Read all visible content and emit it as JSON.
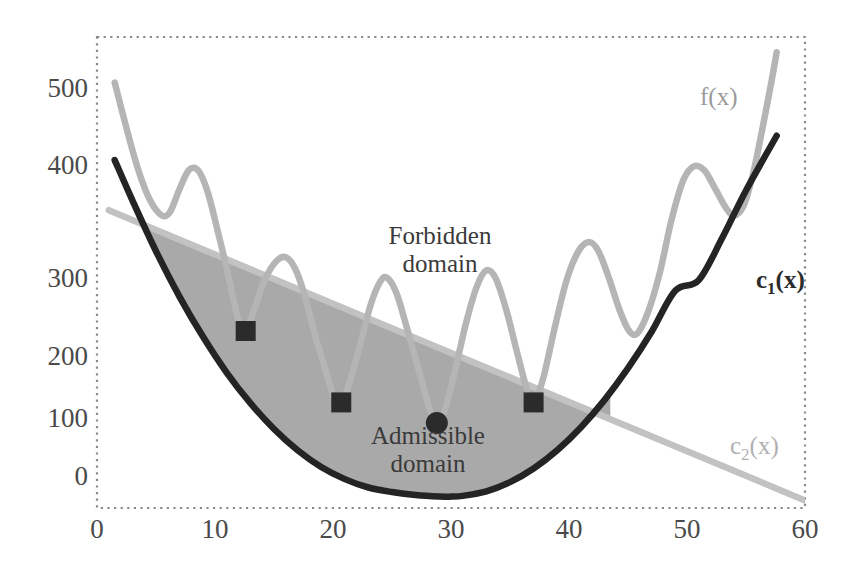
{
  "chart_data": {
    "type": "line",
    "title": "",
    "xlabel": "",
    "ylabel": "",
    "xlim": [
      0,
      60
    ],
    "ylim": [
      -20,
      600
    ],
    "grid": false,
    "legend_position": "inline-annotations",
    "xticks": [
      "0",
      "10",
      "20",
      "30",
      "40",
      "50",
      "60"
    ],
    "xtick_values": [
      0,
      10,
      20,
      30,
      40,
      50,
      60
    ],
    "yticks": [
      "0",
      "100",
      "200",
      "300",
      "400",
      "500"
    ],
    "ytick_values": [
      0,
      100,
      200,
      300,
      400,
      500
    ],
    "annotations": [
      {
        "name": "forbidden-domain",
        "line1": "Forbidden",
        "line2": "domain",
        "x": 31,
        "y": 320
      },
      {
        "name": "admissible-domain",
        "line1": "Admissible",
        "line2": "domain",
        "x": 30,
        "y": 62
      }
    ],
    "series": [
      {
        "name": "f(x)",
        "label": "f(x)",
        "color": "#b5b5b5",
        "style": "oscillating multimodal objective",
        "points": [
          [
            1.5,
            540
          ],
          [
            2.5,
            480
          ],
          [
            3.5,
            425
          ],
          [
            4.5,
            385
          ],
          [
            5.5,
            365
          ],
          [
            6.2,
            370
          ],
          [
            7.0,
            400
          ],
          [
            7.8,
            425
          ],
          [
            8.6,
            424
          ],
          [
            9.4,
            395
          ],
          [
            10.3,
            340
          ],
          [
            11.0,
            295
          ],
          [
            11.6,
            252
          ],
          [
            12.2,
            215
          ],
          [
            12.6,
            213
          ],
          [
            13.3,
            240
          ],
          [
            14.2,
            280
          ],
          [
            15.2,
            305
          ],
          [
            16.0,
            310
          ],
          [
            16.8,
            295
          ],
          [
            17.6,
            260
          ],
          [
            18.4,
            212
          ],
          [
            19.3,
            165
          ],
          [
            20.1,
            125
          ],
          [
            20.7,
            119
          ],
          [
            21.4,
            145
          ],
          [
            22.3,
            195
          ],
          [
            23.2,
            248
          ],
          [
            24.0,
            278
          ],
          [
            24.6,
            283
          ],
          [
            25.4,
            262
          ],
          [
            26.3,
            215
          ],
          [
            27.3,
            160
          ],
          [
            28.2,
            110
          ],
          [
            28.8,
            92
          ],
          [
            29.5,
            110
          ],
          [
            30.4,
            165
          ],
          [
            31.3,
            225
          ],
          [
            32.2,
            272
          ],
          [
            33.0,
            293
          ],
          [
            33.8,
            282
          ],
          [
            34.7,
            240
          ],
          [
            35.6,
            185
          ],
          [
            36.4,
            138
          ],
          [
            37.0,
            119
          ],
          [
            37.8,
            150
          ],
          [
            38.8,
            218
          ],
          [
            39.8,
            280
          ],
          [
            40.8,
            318
          ],
          [
            41.7,
            330
          ],
          [
            42.5,
            318
          ],
          [
            43.4,
            282
          ],
          [
            44.3,
            240
          ],
          [
            45.1,
            213
          ],
          [
            45.8,
            210
          ],
          [
            46.7,
            238
          ],
          [
            47.7,
            290
          ],
          [
            48.7,
            360
          ],
          [
            49.7,
            412
          ],
          [
            50.6,
            430
          ],
          [
            51.5,
            424
          ],
          [
            52.4,
            400
          ],
          [
            53.3,
            375
          ],
          [
            54.0,
            365
          ],
          [
            54.8,
            378
          ],
          [
            55.6,
            420
          ],
          [
            56.4,
            480
          ],
          [
            57.2,
            545
          ],
          [
            57.6,
            580
          ]
        ]
      },
      {
        "name": "c1(x)",
        "label": "c₁(x)",
        "color": "#242424",
        "style": "parabolic constraint (lower bound of admissible domain)",
        "description": "Upward parabola with vertex near x=30, y=0",
        "vertex": [
          30,
          -5
        ],
        "points": [
          [
            1.5,
            438
          ],
          [
            3,
            385
          ],
          [
            5,
            318
          ],
          [
            7,
            258
          ],
          [
            9,
            205
          ],
          [
            11,
            158
          ],
          [
            13,
            118
          ],
          [
            15,
            84
          ],
          [
            17,
            56
          ],
          [
            19,
            34
          ],
          [
            21,
            18
          ],
          [
            23,
            7
          ],
          [
            25,
            1
          ],
          [
            27,
            -3
          ],
          [
            29,
            -5
          ],
          [
            30,
            -5
          ],
          [
            31,
            -4
          ],
          [
            33,
            2
          ],
          [
            35,
            14
          ],
          [
            37,
            32
          ],
          [
            39,
            56
          ],
          [
            41,
            86
          ],
          [
            43,
            122
          ],
          [
            45,
            164
          ],
          [
            47,
            212
          ],
          [
            49,
            266
          ],
          [
            51,
            280
          ],
          [
            53,
            336
          ],
          [
            55,
            398
          ],
          [
            57.6,
            470
          ]
        ]
      },
      {
        "name": "c2(x)",
        "label": "c₂(x)",
        "color": "#c2c2c2",
        "style": "linear constraint (upper bound of admissible domain)",
        "points": [
          [
            1.0,
            372
          ],
          [
            60,
            -10
          ]
        ],
        "slope": -6.5,
        "intercept": 378
      }
    ],
    "markers": [
      {
        "name": "sample-point-1",
        "shape": "square",
        "x": 12.6,
        "y": 213,
        "color": "#2b2b2b"
      },
      {
        "name": "sample-point-2",
        "shape": "square",
        "x": 20.7,
        "y": 119,
        "color": "#2b2b2b"
      },
      {
        "name": "optimum-point",
        "shape": "circle",
        "x": 28.8,
        "y": 92,
        "color": "#2b2b2b"
      },
      {
        "name": "sample-point-3",
        "shape": "square",
        "x": 37.0,
        "y": 119,
        "color": "#2b2b2b"
      }
    ],
    "regions": [
      {
        "name": "admissible-domain",
        "fill": "#a9a9a9",
        "bounded_below_by": "c1(x)",
        "bounded_above_by": "c2(x)",
        "x_range": [
          4.2,
          43.5
        ]
      }
    ],
    "plot_border": {
      "style": "dotted",
      "color": "#8a8a8a"
    }
  },
  "colors": {
    "f_curve": "#b5b5b5",
    "c1_curve": "#242424",
    "c2_curve": "#c2c2c2",
    "admissible_fill": "#a9a9a9",
    "border": "#8a8a8a",
    "tick_text": "#4a4a4a",
    "annotation_text": "#3a3a3a"
  }
}
